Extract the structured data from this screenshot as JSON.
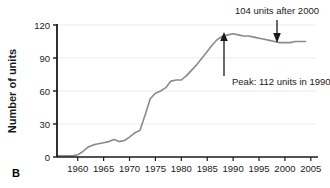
{
  "figure": {
    "panel_label": "B",
    "background_color": "#ffffff",
    "line_color": "#8a8a8a",
    "axis_color": "#1a1a1a",
    "grid_color": "#ebebeb"
  },
  "chart_data": {
    "type": "line",
    "title": "",
    "xlabel": "",
    "ylabel": "Number of units",
    "xlim": [
      1956,
      2006
    ],
    "ylim": [
      0,
      120
    ],
    "xticks": [
      1960,
      1965,
      1970,
      1975,
      1980,
      1985,
      1990,
      1995,
      2000,
      2005
    ],
    "xtick_labels": [
      "1960",
      "1965",
      "1970",
      "1975",
      "1980",
      "1985",
      "1990",
      "1995",
      "2000",
      "2005"
    ],
    "yticks": [
      0,
      30,
      60,
      90,
      120
    ],
    "ytick_labels": [
      "0",
      "30",
      "60",
      "90",
      "120"
    ],
    "grid": "horizontal",
    "legend": "none",
    "x": [
      1956,
      1957,
      1958,
      1959,
      1960,
      1961,
      1962,
      1963,
      1964,
      1965,
      1966,
      1967,
      1968,
      1969,
      1970,
      1971,
      1972,
      1973,
      1974,
      1975,
      1976,
      1977,
      1978,
      1979,
      1980,
      1981,
      1982,
      1983,
      1984,
      1985,
      1986,
      1987,
      1988,
      1989,
      1990,
      1991,
      1992,
      1993,
      1994,
      1995,
      1996,
      1997,
      1998,
      1999,
      2000,
      2001,
      2002,
      2003,
      2004
    ],
    "values": [
      1,
      1,
      1,
      1,
      2,
      5,
      9,
      11,
      12,
      13,
      14,
      16,
      14,
      15,
      18,
      22,
      24,
      38,
      53,
      58,
      60,
      63,
      69,
      70,
      70,
      74,
      79,
      84,
      90,
      96,
      102,
      107,
      110,
      111,
      112,
      111,
      110,
      110,
      109,
      108,
      107,
      106,
      105,
      104,
      104,
      104,
      105,
      105,
      105
    ],
    "annotations": [
      {
        "name": "peak-annotation",
        "text": "Peak: 112 units in 1990",
        "points_to_x": 1990,
        "points_to_y": 112,
        "arrow": "up"
      },
      {
        "name": "post-2000-annotation",
        "text": "104 units after 2000",
        "points_to_x": 2000,
        "points_to_y": 104,
        "arrow": "down"
      }
    ]
  }
}
